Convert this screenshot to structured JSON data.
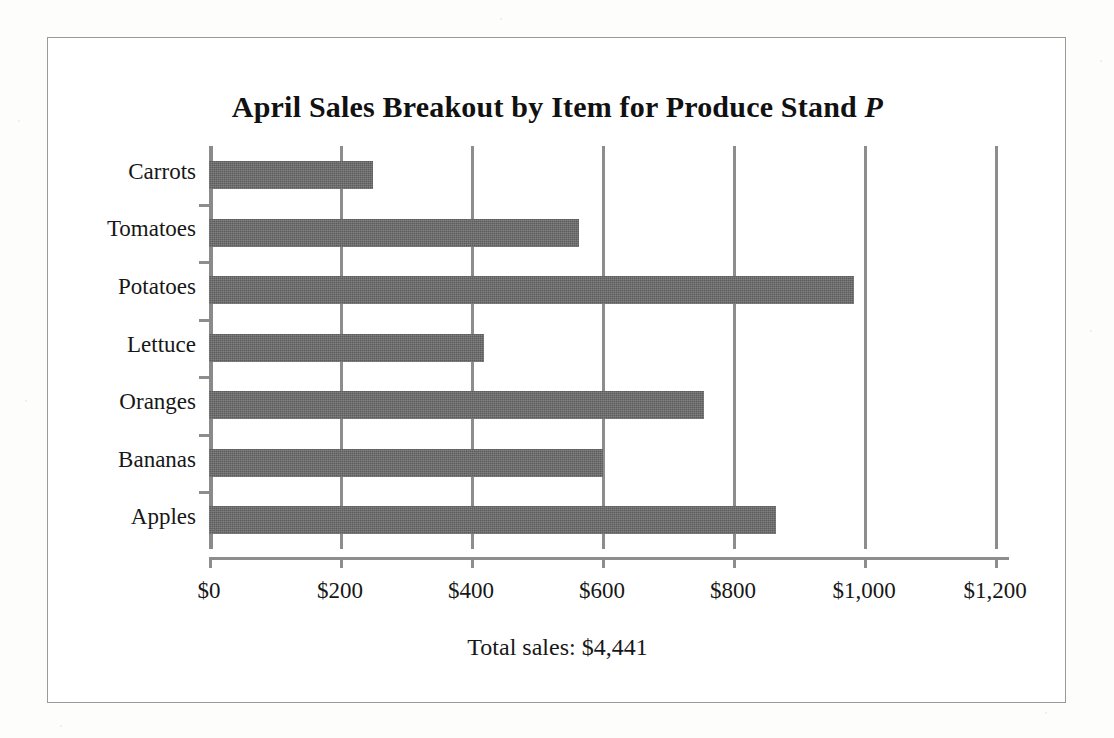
{
  "chart_data": {
    "type": "bar",
    "orientation": "horizontal",
    "title": "April Sales Breakout by Item for Produce Stand ",
    "title_italic_suffix": "P",
    "title_full": "April Sales Breakout by Item for Produce Stand P",
    "categories": [
      "Carrots",
      "Tomatoes",
      "Potatoes",
      "Lettuce",
      "Oranges",
      "Bananas",
      "Apples"
    ],
    "values": [
      250,
      565,
      985,
      420,
      755,
      601,
      865
    ],
    "xlabel": "",
    "ylabel": "",
    "xlim": [
      0,
      1216
    ],
    "xticks": [
      0,
      200,
      400,
      600,
      800,
      1000,
      1200
    ],
    "xticklabels": [
      "$0",
      "$200",
      "$400",
      "$600",
      "$800",
      "$1,000",
      "$1,200"
    ],
    "grid": "vertical",
    "legend": "none",
    "bar_color": "#5c5c5c",
    "axis_color": "#8d8d8d",
    "annotation": "Total sales: $4,441",
    "total_sales": 4441,
    "currency": "$"
  },
  "frame": {
    "border_color": "#9a9a9a",
    "background": "#ffffff"
  }
}
